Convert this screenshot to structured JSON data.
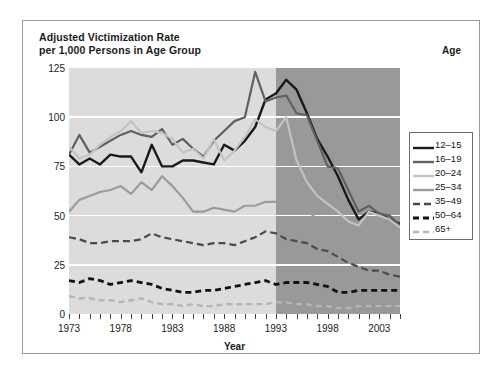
{
  "figure": {
    "title": "Adjusted Victimization Rate\nper 1,000 Persons in Age Group",
    "age_header": "Age",
    "xaxis_title": "Year"
  },
  "chart_data": {
    "type": "line",
    "title": "Adjusted Victimization Rate per 1,000 Persons in Age Group",
    "xlabel": "Year",
    "ylabel": "Adjusted Victimization Rate per 1,000 Persons in Age Group",
    "xlim": [
      1973,
      2005
    ],
    "ylim": [
      0,
      125
    ],
    "grid": true,
    "legend_position": "right",
    "legend_title": "Age",
    "x_tick_labels": [
      "1973",
      "1978",
      "1983",
      "1988",
      "1993",
      "1998",
      "2003"
    ],
    "x_tick_values": [
      1973,
      1978,
      1983,
      1988,
      1993,
      1998,
      2003
    ],
    "y_tick_labels": [
      "0",
      "25",
      "50",
      "75",
      "100",
      "125"
    ],
    "y_tick_values": [
      0,
      25,
      50,
      75,
      100,
      125
    ],
    "minor_x_ticks_every": 1,
    "shaded_regions": [
      {
        "from": 1973,
        "to": 1993,
        "color": "#dcdcdc"
      },
      {
        "from": 1993,
        "to": 2005,
        "color": "#999999"
      }
    ],
    "x": [
      1973,
      1974,
      1975,
      1976,
      1977,
      1978,
      1979,
      1980,
      1981,
      1982,
      1983,
      1984,
      1985,
      1986,
      1987,
      1988,
      1989,
      1990,
      1991,
      1992,
      1993,
      1994,
      1995,
      1996,
      1997,
      1998,
      1999,
      2000,
      2001,
      2002,
      2003,
      2004,
      2005
    ],
    "series": [
      {
        "name": "12-15",
        "color": "#1a1a1a",
        "style": "solid",
        "width": 2.4,
        "values": [
          81,
          76,
          79,
          76,
          81,
          80,
          80,
          72,
          86,
          75,
          75,
          78,
          78,
          77,
          76,
          86,
          83,
          88,
          95,
          109,
          112,
          119,
          114,
          102,
          89,
          80,
          70,
          58,
          48,
          52,
          51,
          48,
          46
        ]
      },
      {
        "name": "16-19",
        "color": "#606060",
        "style": "solid",
        "width": 2.2,
        "values": [
          81,
          91,
          82,
          85,
          88,
          91,
          93,
          91,
          90,
          94,
          86,
          89,
          84,
          80,
          88,
          93,
          98,
          100,
          123,
          108,
          110,
          111,
          102,
          101,
          88,
          75,
          74,
          63,
          52,
          55,
          51,
          50,
          45
        ]
      },
      {
        "name": "20-24",
        "color": "#c3c3c3",
        "style": "solid",
        "width": 2.2,
        "values": [
          85,
          79,
          81,
          86,
          90,
          93,
          98,
          92,
          93,
          92,
          89,
          82,
          84,
          79,
          89,
          78,
          83,
          90,
          99,
          95,
          93,
          100,
          78,
          67,
          60,
          56,
          52,
          47,
          45,
          52,
          50,
          48,
          44
        ]
      },
      {
        "name": "25-34",
        "color": "#9b9b9b",
        "style": "solid",
        "width": 2.2,
        "values": [
          52,
          58,
          60,
          62,
          63,
          65,
          61,
          67,
          63,
          70,
          65,
          59,
          52,
          52,
          54,
          53,
          52,
          55,
          55,
          57,
          57,
          58,
          57,
          53,
          48,
          44,
          39,
          36,
          29,
          27,
          27,
          27,
          26
        ]
      },
      {
        "name": "35-49",
        "color": "#4a4a4a",
        "style": "dashed",
        "dash": "7,4",
        "width": 2.2,
        "values": [
          39,
          38,
          36,
          36,
          37,
          37,
          37,
          38,
          41,
          39,
          38,
          37,
          36,
          35,
          36,
          36,
          35,
          37,
          39,
          42,
          41,
          38,
          37,
          36,
          33,
          32,
          29,
          26,
          24,
          22,
          22,
          20,
          19
        ]
      },
      {
        "name": "50-64",
        "color": "#111111",
        "style": "dashed",
        "dash": "6,4",
        "width": 2.8,
        "values": [
          17,
          16,
          18,
          17,
          15,
          16,
          17,
          16,
          15,
          13,
          12,
          11,
          11,
          12,
          12,
          13,
          14,
          15,
          16,
          17,
          15,
          16,
          16,
          16,
          15,
          14,
          11,
          11,
          12,
          12,
          12,
          12,
          12
        ]
      },
      {
        "name": "65+",
        "color": "#b5b5b5",
        "style": "dashed",
        "dash": "6,4",
        "width": 2.4,
        "values": [
          9,
          8,
          8,
          7,
          7,
          6,
          7,
          8,
          6,
          5,
          5,
          4,
          5,
          4,
          4,
          5,
          5,
          5,
          5,
          5,
          6,
          6,
          5,
          5,
          4,
          4,
          3,
          3,
          4,
          4,
          4,
          4,
          4
        ]
      }
    ]
  },
  "legend": {
    "items": [
      {
        "label": "12-15"
      },
      {
        "label": "16-19"
      },
      {
        "label": "20-24"
      },
      {
        "label": "25-34"
      },
      {
        "label": "35-49"
      },
      {
        "label": "50-64"
      },
      {
        "label": "65+"
      }
    ]
  }
}
